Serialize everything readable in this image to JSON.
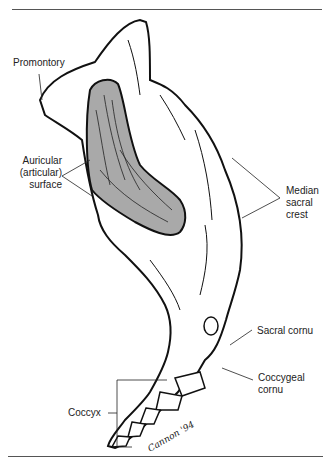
{
  "figure": {
    "fill_color": "#a9a9a9",
    "line_color": "#111111",
    "signature": "Cannon '94",
    "labels": {
      "promontory": "Promontory",
      "auricular_1": "Auricular",
      "auricular_2": "(articular)",
      "auricular_3": "surface",
      "median_1": "Median",
      "median_2": "sacral",
      "median_3": "crest",
      "sacral_cornu": "Sacral cornu",
      "coccygeal_1": "Coccygeal",
      "coccygeal_2": "cornu",
      "coccyx": "Coccyx"
    }
  }
}
